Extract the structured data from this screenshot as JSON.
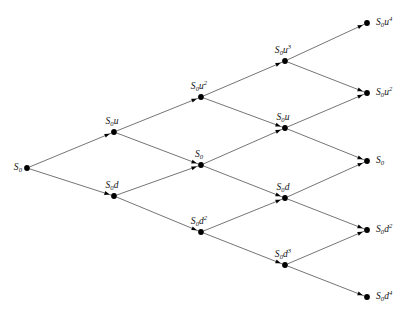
{
  "figure": {
    "name": "recombining-binomial-lattice",
    "type": "diagram",
    "background_color": "#ffffff",
    "line_color": "#3a3a3a",
    "node_color": "#000000",
    "width": 409,
    "height": 319,
    "steps": 4
  },
  "nodes": [
    {
      "id": "n0_0",
      "base": "S",
      "sub": "0",
      "factor": "",
      "exp": "",
      "label_text": "S0",
      "x": 27,
      "y": 168,
      "label_pos": "left",
      "label_x": 22,
      "label_y": 168
    },
    {
      "id": "n1_0",
      "base": "S",
      "sub": "0",
      "factor": "u",
      "exp": "",
      "label_text": "S0u",
      "x": 114,
      "y": 132,
      "label_pos": "above",
      "label_x": 112,
      "label_y": 126
    },
    {
      "id": "n1_1",
      "base": "S",
      "sub": "0",
      "factor": "d",
      "exp": "",
      "label_text": "S0d",
      "x": 114,
      "y": 196,
      "label_pos": "above",
      "label_x": 112,
      "label_y": 190
    },
    {
      "id": "n2_0",
      "base": "S",
      "sub": "0",
      "factor": "u",
      "exp": "2",
      "label_text": "S0u2",
      "x": 201,
      "y": 97,
      "label_pos": "above",
      "label_x": 199,
      "label_y": 91
    },
    {
      "id": "n2_1",
      "base": "S",
      "sub": "0",
      "factor": "",
      "exp": "",
      "label_text": "S0",
      "x": 201,
      "y": 165,
      "label_pos": "above",
      "label_x": 199,
      "label_y": 159
    },
    {
      "id": "n2_2",
      "base": "S",
      "sub": "0",
      "factor": "d",
      "exp": "2",
      "label_text": "S0d2",
      "x": 201,
      "y": 232,
      "label_pos": "above",
      "label_x": 199,
      "label_y": 226
    },
    {
      "id": "n3_0",
      "base": "S",
      "sub": "0",
      "factor": "u",
      "exp": "3",
      "label_text": "S0u3",
      "x": 285,
      "y": 61,
      "label_pos": "above",
      "label_x": 283,
      "label_y": 55
    },
    {
      "id": "n3_1",
      "base": "S",
      "sub": "0",
      "factor": "u",
      "exp": "",
      "label_text": "S0u",
      "x": 285,
      "y": 128,
      "label_pos": "above",
      "label_x": 283,
      "label_y": 122
    },
    {
      "id": "n3_2",
      "base": "S",
      "sub": "0",
      "factor": "d",
      "exp": "",
      "label_text": "S0d",
      "x": 285,
      "y": 198,
      "label_pos": "above",
      "label_x": 283,
      "label_y": 192
    },
    {
      "id": "n3_3",
      "base": "S",
      "sub": "0",
      "factor": "d",
      "exp": "3",
      "label_text": "S0d3",
      "x": 285,
      "y": 265,
      "label_pos": "above",
      "label_x": 283,
      "label_y": 259
    },
    {
      "id": "n4_0",
      "base": "S",
      "sub": "0",
      "factor": "u",
      "exp": "4",
      "label_text": "S0u4",
      "x": 367,
      "y": 23,
      "label_pos": "right",
      "label_x": 376,
      "label_y": 23
    },
    {
      "id": "n4_1",
      "base": "S",
      "sub": "0",
      "factor": "u",
      "exp": "2",
      "label_text": "S0u2",
      "x": 367,
      "y": 93,
      "label_pos": "right",
      "label_x": 376,
      "label_y": 93
    },
    {
      "id": "n4_2",
      "base": "S",
      "sub": "0",
      "factor": "",
      "exp": "",
      "label_text": "S0",
      "x": 367,
      "y": 161,
      "label_pos": "right",
      "label_x": 376,
      "label_y": 161
    },
    {
      "id": "n4_3",
      "base": "S",
      "sub": "0",
      "factor": "d",
      "exp": "2",
      "label_text": "S0d2",
      "x": 367,
      "y": 230,
      "label_pos": "right",
      "label_x": 376,
      "label_y": 230
    },
    {
      "id": "n4_4",
      "base": "S",
      "sub": "0",
      "factor": "d",
      "exp": "4",
      "label_text": "S0d4",
      "x": 367,
      "y": 297,
      "label_pos": "right",
      "label_x": 376,
      "label_y": 297
    }
  ],
  "edges": [
    {
      "id": "e0",
      "from": "n0_0",
      "to": "n1_0",
      "direction": "up"
    },
    {
      "id": "e1",
      "from": "n0_0",
      "to": "n1_1",
      "direction": "down"
    },
    {
      "id": "e2",
      "from": "n1_0",
      "to": "n2_0",
      "direction": "up"
    },
    {
      "id": "e3",
      "from": "n1_0",
      "to": "n2_1",
      "direction": "down"
    },
    {
      "id": "e4",
      "from": "n1_1",
      "to": "n2_1",
      "direction": "up"
    },
    {
      "id": "e5",
      "from": "n1_1",
      "to": "n2_2",
      "direction": "down"
    },
    {
      "id": "e6",
      "from": "n2_0",
      "to": "n3_0",
      "direction": "up"
    },
    {
      "id": "e7",
      "from": "n2_0",
      "to": "n3_1",
      "direction": "down"
    },
    {
      "id": "e8",
      "from": "n2_1",
      "to": "n3_1",
      "direction": "up"
    },
    {
      "id": "e9",
      "from": "n2_1",
      "to": "n3_2",
      "direction": "down"
    },
    {
      "id": "e10",
      "from": "n2_2",
      "to": "n3_2",
      "direction": "up"
    },
    {
      "id": "e11",
      "from": "n2_2",
      "to": "n3_3",
      "direction": "down"
    },
    {
      "id": "e12",
      "from": "n3_0",
      "to": "n4_0",
      "direction": "up"
    },
    {
      "id": "e13",
      "from": "n3_0",
      "to": "n4_1",
      "direction": "down"
    },
    {
      "id": "e14",
      "from": "n3_1",
      "to": "n4_1",
      "direction": "up"
    },
    {
      "id": "e15",
      "from": "n3_1",
      "to": "n4_2",
      "direction": "down"
    },
    {
      "id": "e16",
      "from": "n3_2",
      "to": "n4_2",
      "direction": "up"
    },
    {
      "id": "e17",
      "from": "n3_2",
      "to": "n4_3",
      "direction": "down"
    },
    {
      "id": "e18",
      "from": "n3_3",
      "to": "n4_3",
      "direction": "up"
    },
    {
      "id": "e19",
      "from": "n3_3",
      "to": "n4_4",
      "direction": "down"
    }
  ]
}
